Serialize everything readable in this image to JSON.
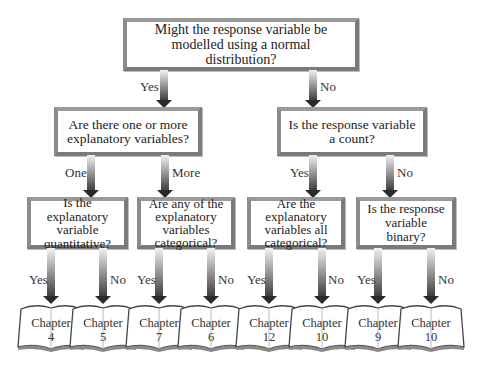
{
  "diagram": {
    "type": "decision-tree",
    "root": {
      "question": "Might the response variable be modelled using a normal distribution?",
      "yes_label": "Yes",
      "no_label": "No"
    },
    "level2": {
      "left": {
        "question": "Are there one or more explanatory variables?",
        "branch_a": "One",
        "branch_b": "More"
      },
      "right": {
        "question": "Is the response variable a count?",
        "branch_a": "Yes",
        "branch_b": "No"
      }
    },
    "level3": [
      {
        "question": "Is the explanatory variable quantitative?",
        "branch_a": "Yes",
        "branch_b": "No"
      },
      {
        "question": "Are any of the explanatory variables categorical?",
        "branch_a": "Yes",
        "branch_b": "No"
      },
      {
        "question": "Are the explanatory variables all categorical?",
        "branch_a": "Yes",
        "branch_b": "No"
      },
      {
        "question": "Is the response variable binary?",
        "branch_a": "Yes",
        "branch_b": "No"
      }
    ],
    "chapters": [
      {
        "label": "Chapter",
        "number": "4"
      },
      {
        "label": "Chapter",
        "number": "5"
      },
      {
        "label": "Chapter",
        "number": "7"
      },
      {
        "label": "Chapter",
        "number": "6"
      },
      {
        "label": "Chapter",
        "number": "12"
      },
      {
        "label": "Chapter",
        "number": "10"
      },
      {
        "label": "Chapter",
        "number": "9"
      },
      {
        "label": "Chapter",
        "number": "10"
      }
    ]
  }
}
